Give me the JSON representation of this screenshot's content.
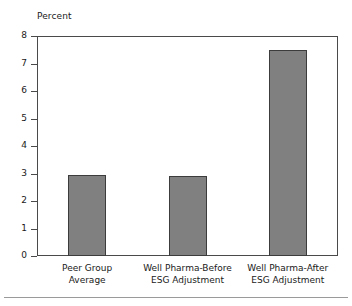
{
  "chart_data": {
    "type": "bar",
    "title": "",
    "subtitle": "",
    "xlabel": "",
    "ylabel": "Percent",
    "ylim": [
      0,
      8
    ],
    "yticks": [
      0,
      1,
      2,
      3,
      4,
      5,
      6,
      7,
      8
    ],
    "ytick_labels": [
      "0",
      "1",
      "2",
      "3",
      "4",
      "5",
      "6",
      "7",
      "8"
    ],
    "grid": false,
    "legend": false,
    "legend_position": "none",
    "categories": [
      "Peer Group\nAverage",
      "Well Pharma-Before\nESG Adjustment",
      "Well Pharma-After\nESG Adjustment"
    ],
    "values": [
      2.95,
      2.9,
      7.5
    ],
    "bar_color": "#808080",
    "bar_edge_color": "#3c3c3c",
    "axis_color": "#4a4a4a",
    "background_color": "#ffffff"
  }
}
